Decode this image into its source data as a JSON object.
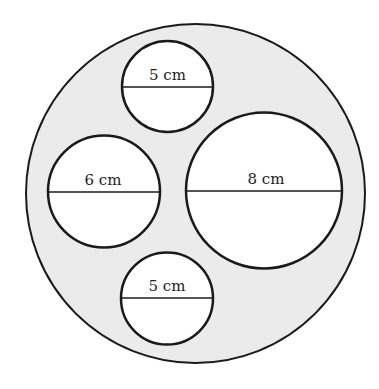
{
  "figure": {
    "outer_circle": {
      "cx": 195.5,
      "cy": 193.5,
      "r": 169.5,
      "fill": "#ebebeb",
      "stroke": "#1a1a1a"
    },
    "circles": [
      {
        "name": "top-small-circle",
        "cx": 167.5,
        "cy": 86.5,
        "r": 45.5,
        "label": "5 cm",
        "diameter_y": 87
      },
      {
        "name": "left-circle",
        "cx": 104,
        "cy": 191.5,
        "r": 56,
        "label": "6 cm",
        "diameter_y": 192
      },
      {
        "name": "right-large-circle",
        "cx": 264,
        "cy": 190.5,
        "r": 78,
        "label": "8 cm",
        "diameter_y": 191
      },
      {
        "name": "bottom-small-circle",
        "cx": 167,
        "cy": 298.5,
        "r": 46,
        "label": "5 cm",
        "diameter_y": 298
      }
    ]
  }
}
